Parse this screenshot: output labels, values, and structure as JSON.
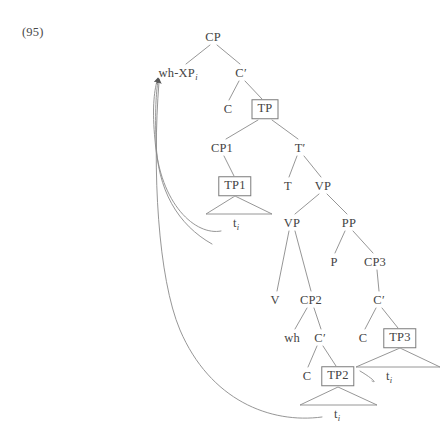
{
  "figure": {
    "example_number": "(95)",
    "type": "syntax-tree",
    "line_color": "#8a8a8a",
    "box_border_color": "#7b7b7b",
    "text_color": "#444444",
    "nodes": [
      {
        "id": "cp",
        "label": "CP",
        "x": 213,
        "y": 37,
        "boxed": false
      },
      {
        "id": "whxp",
        "label": "wh-XP",
        "sub": "i",
        "x": 178,
        "y": 73,
        "boxed": false
      },
      {
        "id": "cbar",
        "label": "C",
        "prime": "′",
        "x": 241,
        "y": 73,
        "boxed": false
      },
      {
        "id": "c-top",
        "label": "C",
        "x": 228,
        "y": 109,
        "boxed": false
      },
      {
        "id": "tp",
        "label": "TP",
        "x": 265,
        "y": 109,
        "boxed": true
      },
      {
        "id": "cp1",
        "label": "CP1",
        "x": 222,
        "y": 148,
        "boxed": false
      },
      {
        "id": "tbar",
        "label": "T",
        "prime": "′",
        "x": 300,
        "y": 148,
        "boxed": false
      },
      {
        "id": "tp1",
        "label": "TP1",
        "x": 235,
        "y": 186,
        "boxed": true
      },
      {
        "id": "t",
        "label": "T",
        "x": 288,
        "y": 186,
        "boxed": false
      },
      {
        "id": "vp-top",
        "label": "VP",
        "x": 323,
        "y": 186,
        "boxed": false
      },
      {
        "id": "t-tp1",
        "label": "t",
        "sub": "i",
        "x": 236,
        "y": 223,
        "boxed": false,
        "trace": true
      },
      {
        "id": "vp-mid",
        "label": "VP",
        "x": 292,
        "y": 223,
        "boxed": false
      },
      {
        "id": "pp",
        "label": "PP",
        "x": 349,
        "y": 223,
        "boxed": false
      },
      {
        "id": "p",
        "label": "P",
        "x": 334,
        "y": 262,
        "boxed": false
      },
      {
        "id": "cp3",
        "label": "CP3",
        "x": 375,
        "y": 262,
        "boxed": false
      },
      {
        "id": "v",
        "label": "V",
        "x": 275,
        "y": 300,
        "boxed": false
      },
      {
        "id": "cp2",
        "label": "CP2",
        "x": 311,
        "y": 300,
        "boxed": false
      },
      {
        "id": "cbar3",
        "label": "C",
        "prime": "′",
        "x": 379,
        "y": 300,
        "boxed": false
      },
      {
        "id": "wh",
        "label": "wh",
        "x": 292,
        "y": 338,
        "boxed": false
      },
      {
        "id": "cbar2",
        "label": "C",
        "prime": "′",
        "x": 320,
        "y": 338,
        "boxed": false
      },
      {
        "id": "c-cp3",
        "label": "C",
        "x": 363,
        "y": 338,
        "boxed": false
      },
      {
        "id": "tp3",
        "label": "TP3",
        "x": 400,
        "y": 338,
        "boxed": true
      },
      {
        "id": "c-cp2",
        "label": "C",
        "x": 307,
        "y": 376,
        "boxed": false
      },
      {
        "id": "tp2",
        "label": "TP2",
        "x": 338,
        "y": 376,
        "boxed": true
      },
      {
        "id": "t-tp3",
        "label": "t",
        "sub": "i",
        "x": 389,
        "y": 376,
        "boxed": false,
        "trace": true
      },
      {
        "id": "t-tp2",
        "label": "t",
        "sub": "i",
        "x": 337,
        "y": 414,
        "boxed": false,
        "trace": true
      }
    ],
    "branches": [
      {
        "from": "cp",
        "to": "whxp",
        "x1": 210,
        "y1": 45,
        "x2": 186,
        "y2": 64
      },
      {
        "from": "cp",
        "to": "cbar",
        "x1": 217,
        "y1": 45,
        "x2": 240,
        "y2": 64
      },
      {
        "from": "cbar",
        "to": "c-top",
        "x1": 239,
        "y1": 81,
        "x2": 229,
        "y2": 100
      },
      {
        "from": "cbar",
        "to": "tp",
        "x1": 245,
        "y1": 81,
        "x2": 262,
        "y2": 99
      },
      {
        "from": "tp",
        "to": "cp1",
        "x1": 258,
        "y1": 120,
        "x2": 226,
        "y2": 139
      },
      {
        "from": "tp",
        "to": "tbar",
        "x1": 272,
        "y1": 120,
        "x2": 298,
        "y2": 139
      },
      {
        "from": "cp1",
        "to": "tp1",
        "x1": 224,
        "y1": 156,
        "x2": 234,
        "y2": 176
      },
      {
        "from": "tbar",
        "to": "t",
        "x1": 297,
        "y1": 156,
        "x2": 289,
        "y2": 177
      },
      {
        "from": "tbar",
        "to": "vp-top",
        "x1": 304,
        "y1": 156,
        "x2": 321,
        "y2": 177
      },
      {
        "from": "vp-top",
        "to": "vp-mid",
        "x1": 319,
        "y1": 194,
        "x2": 295,
        "y2": 214
      },
      {
        "from": "vp-top",
        "to": "pp",
        "x1": 327,
        "y1": 194,
        "x2": 347,
        "y2": 214
      },
      {
        "from": "pp",
        "to": "p",
        "x1": 345,
        "y1": 231,
        "x2": 335,
        "y2": 253
      },
      {
        "from": "pp",
        "to": "cp3",
        "x1": 353,
        "y1": 231,
        "x2": 373,
        "y2": 253
      },
      {
        "from": "vp-mid",
        "to": "v",
        "x1": 289,
        "y1": 231,
        "x2": 277,
        "y2": 291
      },
      {
        "from": "vp-mid",
        "to": "cp2",
        "x1": 295,
        "y1": 231,
        "x2": 311,
        "y2": 291
      },
      {
        "from": "cp3",
        "to": "cbar3",
        "x1": 377,
        "y1": 270,
        "x2": 379,
        "y2": 291
      },
      {
        "from": "cp2",
        "to": "wh",
        "x1": 307,
        "y1": 308,
        "x2": 295,
        "y2": 329
      },
      {
        "from": "cp2",
        "to": "cbar2",
        "x1": 314,
        "y1": 308,
        "x2": 321,
        "y2": 329
      },
      {
        "from": "cbar3",
        "to": "c-cp3",
        "x1": 376,
        "y1": 308,
        "x2": 365,
        "y2": 329
      },
      {
        "from": "cbar3",
        "to": "tp3",
        "x1": 382,
        "y1": 308,
        "x2": 398,
        "y2": 328
      },
      {
        "from": "cbar2",
        "to": "c-cp2",
        "x1": 317,
        "y1": 346,
        "x2": 308,
        "y2": 367
      },
      {
        "from": "cbar2",
        "to": "tp2",
        "x1": 323,
        "y1": 346,
        "x2": 336,
        "y2": 366
      }
    ],
    "triangles": [
      {
        "under": "tp1",
        "apex_x": 235,
        "apex_y": 196,
        "left_x": 206,
        "right_x": 272,
        "base_y": 214
      },
      {
        "under": "tp3",
        "apex_x": 400,
        "apex_y": 348,
        "left_x": 356,
        "right_x": 440,
        "base_y": 367
      },
      {
        "under": "tp2",
        "apex_x": 338,
        "apex_y": 387,
        "left_x": 300,
        "right_x": 377,
        "base_y": 405
      }
    ],
    "movement_arrows": [
      {
        "id": "arrow-from-tp1-trace",
        "from": "t-tp1",
        "to": "whxp",
        "path": "M 221 231 C 196 236, 160 205, 155 140 C 152 110, 154 92, 157 81"
      },
      {
        "id": "arrow-from-tp2-trace-region",
        "from": "t-tp3",
        "to": "whxp",
        "path": "M 212 244 C 178 225, 157 190, 156 140 C 155 112, 156 93, 158 81"
      },
      {
        "id": "arrow-from-bottom-trace",
        "from": "t-tp2",
        "to": "whxp",
        "path": "M 322 417 C 270 424, 210 400, 180 330 C 158 278, 152 170, 159 82"
      },
      {
        "id": "link-tp2-to-tp3-trace",
        "from": "tp2",
        "to": "t-tp3",
        "path": "M 360 371 C 372 378, 378 384, 372 381"
      }
    ]
  }
}
